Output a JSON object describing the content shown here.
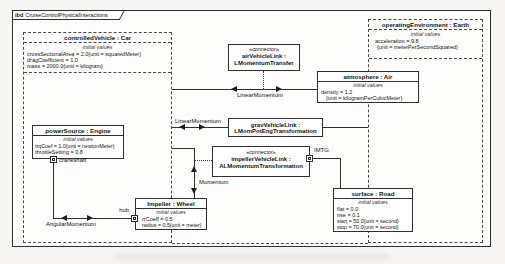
{
  "frame": {
    "kind": "ibd",
    "title": "CruiseControlPhysicalInteractions"
  },
  "labels": {
    "initial_values": "initial values"
  },
  "blocks": {
    "car": {
      "title": "controlledVehicle : Car",
      "values": [
        "crossSectionalArea = 2.0{unit = squaredMeter}",
        "dragCoefficient = 1.0",
        "mass = 2000.0{unit = kilogram}"
      ]
    },
    "earth": {
      "title": "operatingEnvironment : Earth",
      "values": [
        "acceleration = 9.8",
        "{unit = meterPerSecondSquared}"
      ]
    },
    "air": {
      "title": "atmosphere : Air",
      "values": [
        "density = 1.2",
        "{unit = kilogramPerCubicMeter}"
      ]
    },
    "road": {
      "title": "surface : Road",
      "values": [
        "flat = 0.0",
        "rise = 0.1",
        "start = 50.0{unit = second}",
        "stop = 70.0{unit = second}"
      ]
    },
    "engine": {
      "title": "powerSource : Engine",
      "values": [
        "trqCoef = 1.0{unit = newtonMeter}",
        "throttleSetting = 0.8"
      ]
    },
    "wheel": {
      "title": "Impeller : Wheel",
      "values": [
        "rrCoeff = 0.5",
        "radius = 0.5{unit = meter}"
      ]
    }
  },
  "connectors": {
    "air_vehicle_link": {
      "stereotype": "«connector»",
      "name": "airVehicleLink :",
      "type": "LMomentumTransfer"
    },
    "grav_vehicle_link": {
      "name": "gravVehicleLink :",
      "type": "LMomPotEngTransformation"
    },
    "impeller_vehicle_link": {
      "stereotype": "«connector»",
      "name": "impellerVehicleLink :",
      "type": "ALMomentumTransformation"
    }
  },
  "item_flows": {
    "air_flow": "LinearMomentum",
    "grav_flow": "LinearMomentum",
    "impeller_flow": "Momentum",
    "crank_flow": "AngularMomentum"
  },
  "ports": {
    "crankshaft": "crankshaft",
    "hub": "hub",
    "imtg": "IMTG"
  },
  "colors": {
    "line": "#2f2f2f",
    "text": "#141414",
    "node_fill": "#ffffff",
    "page_background": "#f6f5f2"
  }
}
